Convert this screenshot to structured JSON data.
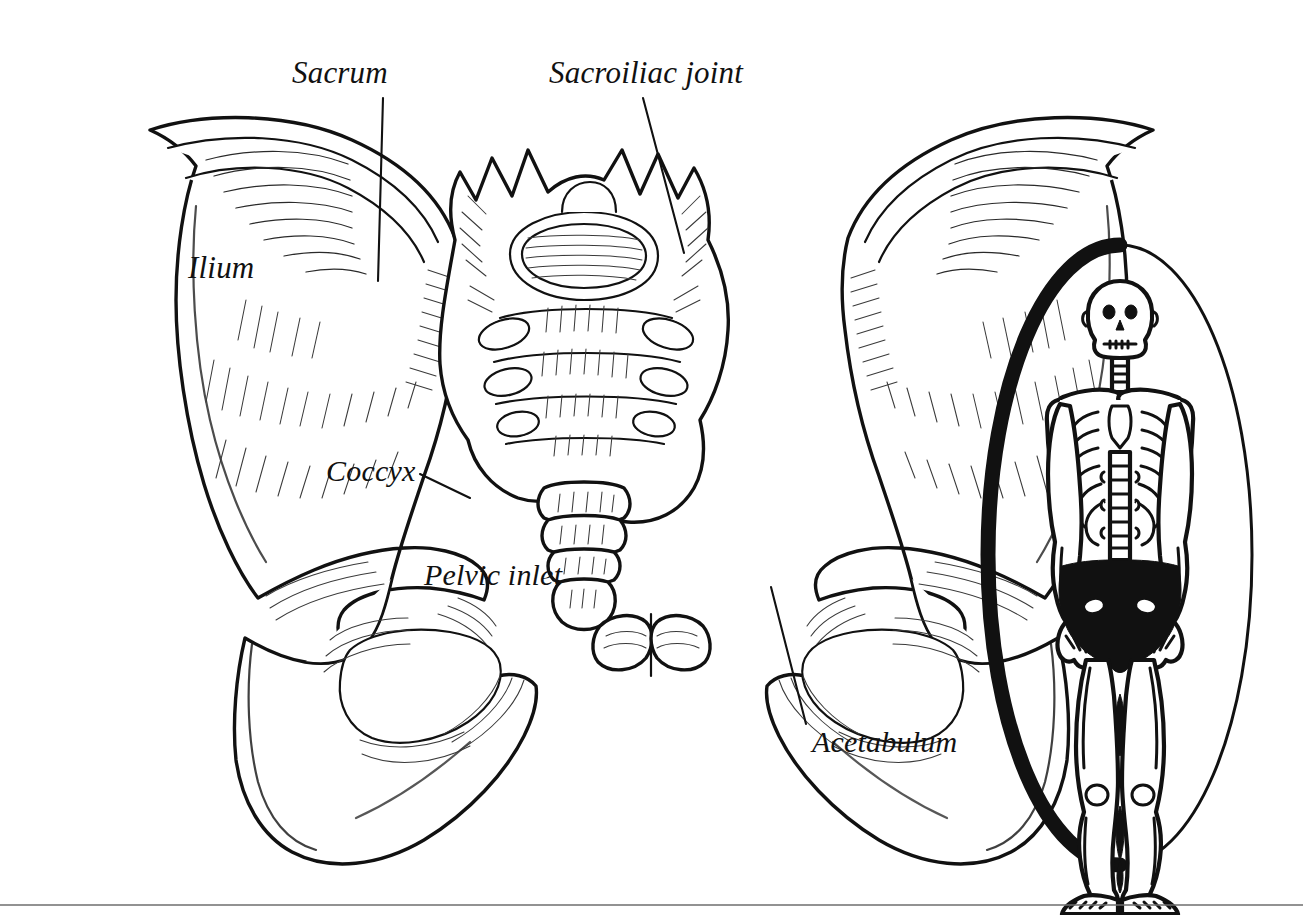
{
  "figure": {
    "style": "pen-and-ink line drawing, black on white",
    "labels": [
      {
        "id": "sacrum",
        "text": "Sacrum",
        "x": 292,
        "y": 83,
        "leader": {
          "x1": 383,
          "y1": 98,
          "x2": 378,
          "y2": 281
        }
      },
      {
        "id": "sacroiliac-joint",
        "text": "Sacroiliac joint",
        "x": 549,
        "y": 83,
        "leader": {
          "x1": 643,
          "y1": 98,
          "x2": 684,
          "y2": 253
        }
      },
      {
        "id": "ilium",
        "text": "Ilium",
        "x": 188,
        "y": 278,
        "leader": null
      },
      {
        "id": "coccyx",
        "text": "Coccyx",
        "x": 326,
        "y": 481,
        "leader": {
          "x1": 420,
          "y1": 474,
          "x2": 470,
          "y2": 498
        }
      },
      {
        "id": "pelvic-inlet",
        "text": "Pelvic inlet",
        "x": 424,
        "y": 585,
        "leader": null
      },
      {
        "id": "acetabulum",
        "text": "Acetabulum",
        "x": 812,
        "y": 752,
        "leader": {
          "x1": 806,
          "y1": 724,
          "x2": 771,
          "y2": 587
        }
      }
    ],
    "inset": {
      "id": "whole-skeleton-inset",
      "description": "Anterior whole-body skeleton inside an oval frame; the pelvis is filled solid black to highlight the region shown in the main drawing",
      "highlight_color": "#111111",
      "frame_shape": "oval",
      "frame_color": "#111111",
      "center_x": 1120,
      "center_y": 555,
      "radius_x": 132,
      "radius_y": 310
    },
    "footer_rule": {
      "y": 905,
      "color": "#6e6e6e"
    },
    "colors": {
      "ink": "#111111",
      "paper": "#ffffff",
      "hatch": "#2a2a2a",
      "rule": "#6e6e6e"
    }
  }
}
